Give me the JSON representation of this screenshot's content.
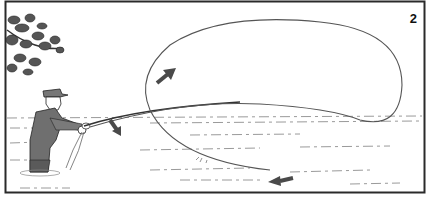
{
  "figure": {
    "panel_number": "2",
    "elements": [
      {
        "name": "tree-branch",
        "position": "top-left"
      },
      {
        "name": "angler",
        "position": "left, waist-deep in water"
      },
      {
        "name": "fly-rod",
        "position": "extending right from angler"
      },
      {
        "name": "line-loop",
        "position": "large loop across upper right"
      },
      {
        "name": "arrow-down",
        "position": "near rod tip, pointing down-right"
      },
      {
        "name": "arrow-up",
        "position": "inside loop, pointing up-right"
      },
      {
        "name": "arrow-left",
        "position": "bottom right on water, pointing left"
      }
    ],
    "colors": {
      "border": "#2a2a2a",
      "line": "#555555",
      "arrow": "#4a4a4a",
      "water_marks": "#9a9a9a",
      "figure_fill": "#6f6f6f"
    }
  }
}
